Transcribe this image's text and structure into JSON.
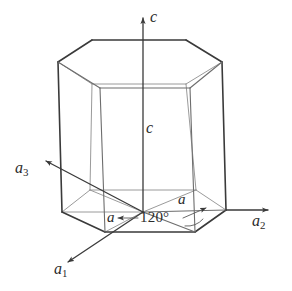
{
  "figure": {
    "background_color": "#ffffff",
    "line_color_front": "#3a3a3a",
    "line_color_back": "#8a8a8a",
    "axis_color": "#4a4a4a",
    "text_color": "#2b2b2b"
  },
  "axes": {
    "c": {
      "label": "c",
      "direction": "up"
    },
    "a1": {
      "label": "a",
      "subscript": "1",
      "direction": "down-left"
    },
    "a2": {
      "label": "a",
      "subscript": "2",
      "direction": "right"
    },
    "a3": {
      "label": "a",
      "subscript": "3",
      "direction": "up-left"
    }
  },
  "dimensions": {
    "height_label": "c",
    "edge_label_left": "a",
    "edge_label_right": "a",
    "angle_label": "120°",
    "angle_value": 120,
    "angle_unit": "degrees"
  },
  "shape": {
    "type": "hexagonal prism",
    "top_face": "hexagon",
    "bottom_face": "hexagon",
    "lateral_faces": 6
  }
}
